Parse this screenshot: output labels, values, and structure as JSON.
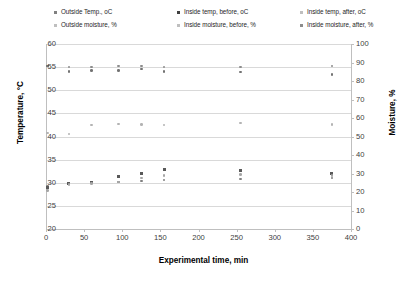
{
  "chart_data": {
    "type": "scatter",
    "title": "",
    "xlabel": "Experimental time, min",
    "ylabel": "Temperature, °C",
    "y2label": "Moisture, %",
    "xlim": [
      0,
      400
    ],
    "ylim": [
      20,
      60
    ],
    "y2lim": [
      0,
      100
    ],
    "xticks": [
      "0",
      "50",
      "100",
      "150",
      "200",
      "250",
      "300",
      "350",
      "400"
    ],
    "yticks": [
      "20",
      "25",
      "30",
      "35",
      "40",
      "45",
      "50",
      "55",
      "60"
    ],
    "y2ticks": [
      "0",
      "10",
      "20",
      "30",
      "40",
      "50",
      "60",
      "70",
      "80",
      "90",
      "100"
    ],
    "grid": true,
    "legend_position": "top",
    "series": [
      {
        "name": "Outside Temp., oC",
        "axis": "left",
        "marker": "dot",
        "color": "#808080",
        "x": [
          2,
          30,
          60,
          95,
          125,
          155,
          255,
          375
        ],
        "y": [
          29.2,
          29.8,
          30.0,
          30.2,
          30.4,
          30.6,
          30.8,
          31.0
        ]
      },
      {
        "name": "Inside temp, before, oC",
        "axis": "left",
        "marker": "square",
        "color": "#595959",
        "x": [
          2,
          30,
          60,
          95,
          125,
          155,
          255,
          375
        ],
        "y": [
          29.0,
          29.9,
          30.1,
          31.3,
          32.0,
          32.8,
          32.6,
          31.9
        ]
      },
      {
        "name": "Inside temp, after, oC",
        "axis": "left",
        "marker": "dot",
        "color": "#a6a6a6",
        "x": [
          2,
          30,
          60,
          95,
          125,
          155,
          255,
          375
        ],
        "y": [
          28.3,
          29.6,
          29.9,
          30.2,
          31.0,
          31.6,
          31.8,
          31.6
        ]
      },
      {
        "name": "Outside moisture, %",
        "axis": "right",
        "marker": "dot",
        "color": "#8c8c8c",
        "x": [
          2,
          30,
          60,
          95,
          125,
          155,
          255,
          375
        ],
        "y": [
          88.0,
          87.5,
          87.6,
          88.0,
          88.2,
          87.6,
          87.5,
          88.0
        ]
      },
      {
        "name": "Inside moisture, before, %",
        "axis": "right",
        "marker": "dot",
        "color": "#737373",
        "x": [
          2,
          30,
          60,
          95,
          125,
          155,
          255,
          375
        ],
        "y": [
          88.0,
          85.2,
          85.6,
          85.8,
          86.4,
          85.0,
          84.8,
          83.4
        ]
      },
      {
        "name": "Inside moisture, after, %",
        "axis": "right",
        "marker": "dot",
        "color": "#b3b3b3",
        "x": [
          2,
          30,
          60,
          95,
          125,
          155,
          255,
          375
        ],
        "y": [
          52.0,
          51.4,
          56.2,
          56.8,
          56.4,
          56.2,
          57.4,
          56.6
        ]
      }
    ]
  },
  "legend": {
    "rows": [
      [
        {
          "label": "Outside Temp., oC",
          "color": "#808080"
        },
        {
          "label": "Inside temp, before, oC",
          "color": "#404040"
        },
        {
          "label": "Inside temp, after, oC",
          "color": "#bfbfbf"
        }
      ],
      [
        {
          "label": "Outside moisture, %",
          "color": "#bfbfbf"
        },
        {
          "label": "Inside moisture, before, %",
          "color": "#bfbfbf"
        },
        {
          "label": "Inside moisture, after, %",
          "color": "#8c8c8c"
        }
      ]
    ]
  }
}
